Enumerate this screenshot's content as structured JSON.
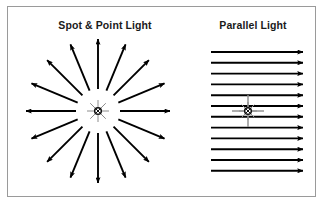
{
  "figure": {
    "width": 324,
    "height": 205,
    "background_color": "#ffffff",
    "border_color": "#9a9a9a",
    "arrow_color": "#000000",
    "light_symbol_color": "#8c8c8c",
    "title_color": "#1a1a1a"
  },
  "panels": [
    {
      "id": "spot-point-light",
      "title": "Spot & Point Light",
      "diagram_type": "radial-rays",
      "center": {
        "x": 98,
        "y": 111
      },
      "ray_count": 16,
      "ray_angle_step_deg": 22.5,
      "ray_start_radius": 22,
      "ray_end_radius": 72,
      "light_symbol": "point-light-star"
    },
    {
      "id": "parallel-light",
      "title": "Parallel Light",
      "diagram_type": "parallel-rays",
      "center": {
        "x": 248,
        "y": 111
      },
      "ray_count": 12,
      "ray_x_start": 211,
      "ray_x_end": 303,
      "ray_y_first": 52,
      "ray_y_spacing": 10.8,
      "light_symbol": "directional-light-cross"
    }
  ],
  "chart_data": {
    "type": "diagram",
    "legend": [
      "Spot & Point Light",
      "Parallel Light"
    ],
    "series": [
      {
        "name": "Spot & Point Light",
        "description": "16 arrows radiating outward from a single point light source at 22.5 degree increments",
        "values": [
          0,
          22.5,
          45,
          67.5,
          90,
          112.5,
          135,
          157.5,
          180,
          202.5,
          225,
          247.5,
          270,
          292.5,
          315,
          337.5
        ]
      },
      {
        "name": "Parallel Light",
        "description": "12 horizontal arrows of equal length pointing right, evenly spaced vertically",
        "values": [
          1,
          2,
          3,
          4,
          5,
          6,
          7,
          8,
          9,
          10,
          11,
          12
        ]
      }
    ]
  }
}
